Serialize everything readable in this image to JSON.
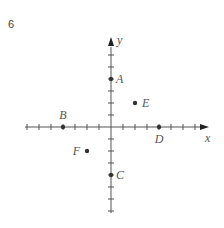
{
  "problem": {
    "number": "6"
  },
  "chart_data": {
    "type": "scatter",
    "title": "",
    "xlabel": "x",
    "ylabel": "y",
    "xlim": [
      -7,
      8
    ],
    "ylim": [
      -7,
      7
    ],
    "grid": false,
    "tick_spacing": 1,
    "points": [
      {
        "label": "A",
        "x": 0,
        "y": 4
      },
      {
        "label": "B",
        "x": -4,
        "y": 0
      },
      {
        "label": "C",
        "x": 0,
        "y": -4
      },
      {
        "label": "D",
        "x": 4,
        "y": 0
      },
      {
        "label": "E",
        "x": 2,
        "y": 2
      },
      {
        "label": "F",
        "x": -2,
        "y": -2
      }
    ]
  },
  "axes": {
    "x_label": "x",
    "y_label": "y"
  },
  "colors": {
    "axis": "#555555",
    "point": "#333333",
    "label": "#555555"
  }
}
